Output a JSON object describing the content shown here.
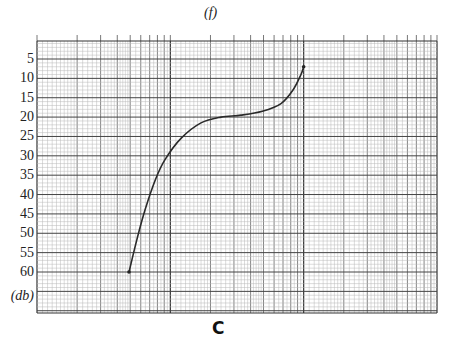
{
  "chart_data": {
    "type": "line",
    "title": "",
    "xlabel": "(f)",
    "ylabel": "(db)",
    "x_scale": "log",
    "x_decades": 3,
    "x_range_hz_assumed": [
      10,
      10000
    ],
    "ylim": [
      0,
      70
    ],
    "y_inverted": true,
    "y_ticks": [
      5,
      10,
      15,
      20,
      25,
      30,
      35,
      40,
      45,
      50,
      55,
      60
    ],
    "y_tick_labels": [
      "5",
      "10",
      "15",
      "20",
      "25",
      "30",
      "35",
      "40",
      "45",
      "50",
      "55",
      "60"
    ],
    "grid": true,
    "series": [
      {
        "name": "response curve",
        "x_decade_position": [
          0.69,
          0.75,
          0.81,
          0.89,
          0.96,
          1.08,
          1.23,
          1.38,
          1.53,
          1.69,
          1.83,
          1.92,
          1.98,
          2.0
        ],
        "values_db": [
          60,
          51.5,
          44,
          36,
          31,
          25.5,
          21.5,
          20,
          19.5,
          18.5,
          16.5,
          13,
          9,
          7
        ]
      }
    ],
    "caption": "C"
  },
  "labels": {
    "x_axis": "(f)",
    "y_axis": "(db)",
    "caption": "C"
  }
}
